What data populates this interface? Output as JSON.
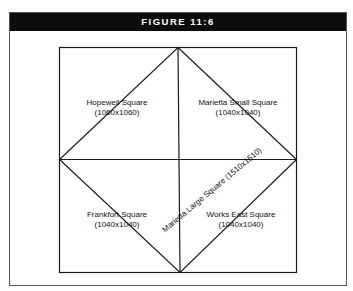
{
  "figure": {
    "title": "FIGURE 11:6"
  },
  "diagram": {
    "regions": [
      {
        "name": "Hopewell Square",
        "size": "(1060x1060)"
      },
      {
        "name": "Marietta Small Square",
        "size": "(1040x1040)"
      },
      {
        "name": "Frankfort  Square",
        "size": "(1040x1040)"
      },
      {
        "name": "Works East Square",
        "size": "(1040x1040)"
      }
    ],
    "diagonal_label": "Marietta Large Square (1510x1510)"
  }
}
